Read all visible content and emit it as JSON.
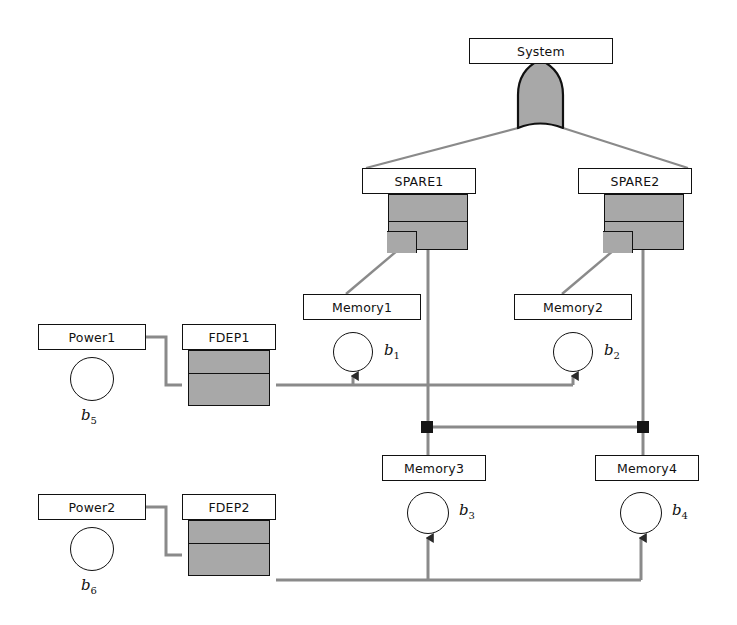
{
  "diagram": {
    "colors": {
      "gate_fill": "#a8a8a8",
      "outline": "#111111",
      "wire_black": "#7a7a7a",
      "wire_gray": "#808080",
      "background": "#ffffff"
    },
    "nodes": [
      {
        "id": "system",
        "label": "System",
        "type": "box",
        "x": 469,
        "y": 38,
        "w": 144,
        "h": 26
      },
      {
        "id": "spare1",
        "label": "SPARE1",
        "type": "box",
        "x": 362,
        "y": 168,
        "w": 114,
        "h": 26
      },
      {
        "id": "spare2",
        "label": "SPARE2",
        "type": "box",
        "x": 578,
        "y": 168,
        "w": 114,
        "h": 26
      },
      {
        "id": "memory1",
        "label": "Memory1",
        "type": "box",
        "x": 303,
        "y": 294,
        "w": 118,
        "h": 26
      },
      {
        "id": "memory2",
        "label": "Memory2",
        "type": "box",
        "x": 514,
        "y": 294,
        "w": 118,
        "h": 26
      },
      {
        "id": "memory3",
        "label": "Memory3",
        "type": "box",
        "x": 382,
        "y": 455,
        "w": 104,
        "h": 26
      },
      {
        "id": "memory4",
        "label": "Memory4",
        "type": "box",
        "x": 595,
        "y": 455,
        "w": 104,
        "h": 26
      },
      {
        "id": "power1",
        "label": "Power1",
        "type": "box",
        "x": 38,
        "y": 324,
        "w": 108,
        "h": 26
      },
      {
        "id": "power2",
        "label": "Power2",
        "type": "box",
        "x": 38,
        "y": 494,
        "w": 108,
        "h": 26
      },
      {
        "id": "fdep1",
        "label": "FDEP1",
        "type": "box",
        "x": 182,
        "y": 324,
        "w": 94,
        "h": 26
      },
      {
        "id": "fdep2",
        "label": "FDEP2",
        "type": "box",
        "x": 182,
        "y": 494,
        "w": 94,
        "h": 26
      }
    ],
    "gates": [
      {
        "id": "or-gate",
        "parent": "system",
        "shape": "or",
        "label": "OR gate"
      },
      {
        "id": "spare1-gate",
        "parent": "spare1",
        "shape": "spare",
        "label": "SPARE gate 1"
      },
      {
        "id": "spare2-gate",
        "parent": "spare2",
        "shape": "spare",
        "label": "SPARE gate 2"
      },
      {
        "id": "fdep1-gate",
        "parent": "fdep1",
        "shape": "fdep",
        "label": "FDEP gate 1"
      },
      {
        "id": "fdep2-gate",
        "parent": "fdep2",
        "shape": "fdep",
        "label": "FDEP gate 2"
      }
    ],
    "basic_events": [
      {
        "id": "b1",
        "label": "b",
        "sub": "1",
        "parent": "memory1",
        "cx": 353,
        "cy": 352,
        "r": 20,
        "label_pos": "right"
      },
      {
        "id": "b2",
        "label": "b",
        "sub": "2",
        "parent": "memory2",
        "cx": 573,
        "cy": 352,
        "r": 20,
        "label_pos": "right"
      },
      {
        "id": "b3",
        "label": "b",
        "sub": "3",
        "parent": "memory3",
        "cx": 428,
        "cy": 513,
        "r": 21,
        "label_pos": "right"
      },
      {
        "id": "b4",
        "label": "b",
        "sub": "4",
        "parent": "memory4",
        "cx": 641,
        "cy": 513,
        "r": 21,
        "label_pos": "right"
      },
      {
        "id": "b5",
        "label": "b",
        "sub": "5",
        "parent": "power1",
        "cx": 92,
        "cy": 379,
        "r": 22,
        "label_pos": "below"
      },
      {
        "id": "b6",
        "label": "b",
        "sub": "6",
        "parent": "power2",
        "cx": 92,
        "cy": 549,
        "r": 22,
        "label_pos": "below"
      }
    ],
    "junctions": [
      {
        "id": "junction-left",
        "x": 427,
        "y": 427
      },
      {
        "id": "junction-right",
        "x": 643,
        "y": 427
      }
    ],
    "edges": [
      {
        "id": "edge-or-spare1",
        "from": "or-gate",
        "to": "spare1",
        "style": "diagonal"
      },
      {
        "id": "edge-or-spare2",
        "from": "or-gate",
        "to": "spare2",
        "style": "diagonal"
      },
      {
        "id": "edge-spare1-memory1",
        "from": "spare1-gate",
        "to": "memory1",
        "style": "diagonal"
      },
      {
        "id": "edge-spare2-memory2",
        "from": "spare2-gate",
        "to": "memory2",
        "style": "diagonal"
      },
      {
        "id": "edge-spare1-memory3",
        "from": "spare1-gate",
        "to": "memory3",
        "style": "vertical"
      },
      {
        "id": "edge-spare2-memory4",
        "from": "spare2-gate",
        "to": "memory4",
        "style": "vertical"
      },
      {
        "id": "edge-power1-fdep1",
        "from": "power1",
        "to": "fdep1",
        "style": "stepped"
      },
      {
        "id": "edge-power2-fdep2",
        "from": "power2",
        "to": "fdep2",
        "style": "stepped"
      },
      {
        "id": "edge-fdep1-b1",
        "from": "fdep1-gate",
        "to": "b1",
        "style": "arrow-up"
      },
      {
        "id": "edge-fdep1-b2",
        "from": "fdep1-gate",
        "to": "b2",
        "style": "arrow-up"
      },
      {
        "id": "edge-fdep2-b3",
        "from": "fdep2-gate",
        "to": "b3",
        "style": "arrow-up"
      },
      {
        "id": "edge-fdep2-b4",
        "from": "fdep2-gate",
        "to": "b4",
        "style": "arrow-up"
      },
      {
        "id": "edge-junction-link",
        "from": "junction-left",
        "to": "junction-right",
        "style": "horizontal"
      }
    ]
  }
}
